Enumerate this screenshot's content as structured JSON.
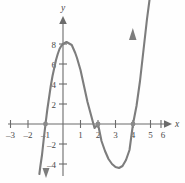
{
  "chart_data": {
    "type": "line",
    "title": "",
    "subtitle": "",
    "xlabel": "x",
    "ylabel": "y",
    "xlim": [
      -3.6,
      6.6
    ],
    "ylim": [
      -5.0,
      9.2
    ],
    "grid": false,
    "legend": null,
    "x_ticks": [
      -3,
      -2,
      -1,
      1,
      2,
      3,
      4,
      5,
      6
    ],
    "x_tick_labels": [
      "–3",
      "–2",
      "–1",
      "1",
      "2",
      "3",
      "4",
      "5",
      "6"
    ],
    "y_ticks": [
      2,
      4,
      6,
      8,
      -2,
      -4
    ],
    "y_tick_labels": [
      "2",
      "4",
      "6",
      "8",
      "–2",
      "–4"
    ],
    "series": [
      {
        "name": "cubic",
        "color": "#7d7d7d",
        "equation": "y = (x + 1)(x - 2)(x - 4)",
        "x": [
          -1.35,
          -1.3,
          -1.2,
          -1.1,
          -1.0,
          -0.9,
          -0.8,
          -0.7,
          -0.6,
          -0.5,
          -0.4,
          -0.3,
          -0.2,
          -0.1,
          0.0,
          0.1,
          0.2,
          0.3,
          0.4,
          0.5,
          0.6,
          0.7,
          0.8,
          0.9,
          1.0,
          1.2,
          1.4,
          1.6,
          1.8,
          2.0,
          2.2,
          2.4,
          2.6,
          2.8,
          3.0,
          3.2,
          3.4,
          3.6,
          3.8,
          4.0,
          4.2,
          4.4,
          4.6,
          4.8,
          4.95
        ],
        "y": [
          -5.0,
          -4.3,
          -3.1,
          -1.5,
          0.0,
          1.4,
          2.6,
          3.8,
          4.8,
          5.6,
          6.4,
          7.0,
          7.5,
          7.8,
          8.0,
          8.1,
          8.2,
          8.1,
          8.0,
          7.9,
          7.5,
          7.1,
          6.6,
          6.0,
          5.4,
          3.8,
          2.2,
          0.9,
          -0.4,
          0.0,
          -1.7,
          -2.7,
          -3.5,
          -4.0,
          -4.3,
          -4.4,
          -4.2,
          -3.6,
          -2.6,
          0.0,
          1.8,
          4.3,
          7.4,
          10.5,
          12.5
        ]
      }
    ],
    "marked_points": [
      {
        "label": "x-intercept",
        "x": -1,
        "y": 0
      },
      {
        "label": "x-intercept",
        "x": 2,
        "y": 0
      },
      {
        "label": "x-intercept",
        "x": 4,
        "y": 0
      }
    ],
    "local_maximum": {
      "x": 0.2,
      "y": 8.2
    },
    "local_minimum": {
      "x": 3.2,
      "y": -4.4
    },
    "axis_arrows": [
      "x-positive",
      "y-positive"
    ],
    "curve_arrows": [
      "down-left-end",
      "up-right-end"
    ]
  }
}
